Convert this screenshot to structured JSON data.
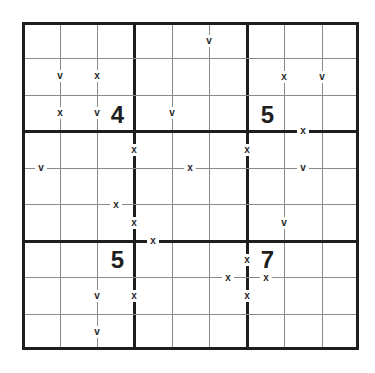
{
  "puzzle": {
    "type": "XV Sudoku",
    "size": 9,
    "givens": [
      {
        "row": 3,
        "col": 3,
        "value": "4"
      },
      {
        "row": 3,
        "col": 7,
        "value": "5"
      },
      {
        "row": 7,
        "col": 3,
        "value": "5"
      },
      {
        "row": 7,
        "col": 7,
        "value": "7"
      }
    ],
    "markers": [
      {
        "label": "v",
        "between": "r2c1-r2c2"
      },
      {
        "label": "x",
        "between": "r2c2-r2c3"
      },
      {
        "label": "x",
        "between": "r3c1-r3c2"
      },
      {
        "label": "v",
        "between": "r3c2-r3c3"
      },
      {
        "label": "v",
        "between": "r1c5-r1c6"
      },
      {
        "label": "v",
        "between": "r3c4-r3c5"
      },
      {
        "label": "x",
        "between": "r2c7-r2c8"
      },
      {
        "label": "v",
        "between": "r2c8-r2c9"
      },
      {
        "label": "x",
        "between": "r3c8-r4c8"
      },
      {
        "label": "x",
        "between": "r4c3-r4c4"
      },
      {
        "label": "v",
        "between": "r4c1-r5c1"
      },
      {
        "label": "x",
        "between": "r5c3-r6c3"
      },
      {
        "label": "x",
        "between": "r6c3-r6c4"
      },
      {
        "label": "x",
        "between": "r4c5-r5c5"
      },
      {
        "label": "x",
        "between": "r4c6-r4c7"
      },
      {
        "label": "x",
        "between": "r6c4-r7c4"
      },
      {
        "label": "v",
        "between": "r4c8-r5c8"
      },
      {
        "label": "v",
        "between": "r6c7-r6c8"
      },
      {
        "label": "v",
        "between": "r8c2-r8c3"
      },
      {
        "label": "x",
        "between": "r8c3-r8c4"
      },
      {
        "label": "v",
        "between": "r9c2-r9c3"
      },
      {
        "label": "x",
        "between": "r7c6-r7c7"
      },
      {
        "label": "x",
        "between": "r7c6-r8c6"
      },
      {
        "label": "x",
        "between": "r7c7-r8c7"
      },
      {
        "label": "x",
        "between": "r8c6-r8c7"
      }
    ]
  }
}
